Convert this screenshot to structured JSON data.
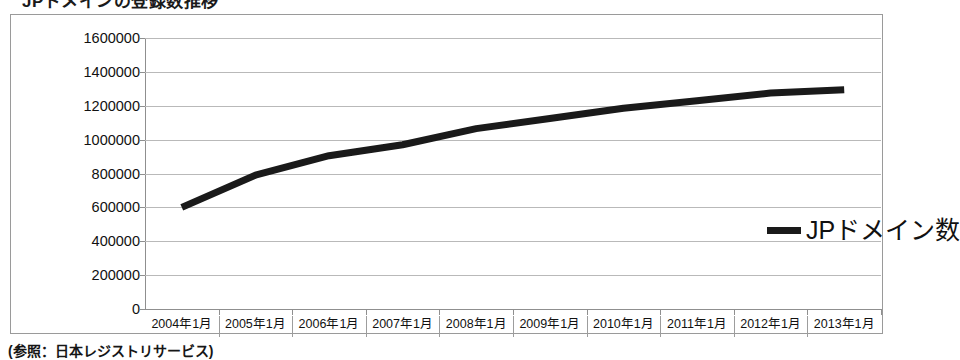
{
  "page": {
    "title_partial": "JPドメインの登録数推移",
    "caption": "(参照：日本レジストリサービス)"
  },
  "legend": {
    "series_label": "JPドメイン数",
    "position": "inside-right",
    "swatch_color": "#1a1a1a"
  },
  "colors": {
    "line": "#1a1a1a",
    "gridline": "#b9b9b9",
    "axis": "#8f8f8f",
    "frame_border": "#9a9a9a",
    "background": "#ffffff"
  },
  "chart_data": {
    "type": "line",
    "title": "JPドメインの登録数推移",
    "xlabel": "",
    "ylabel": "",
    "ylim": [
      0,
      1600000
    ],
    "ytick_step": 200000,
    "ytick_labels": [
      "1600000",
      "1400000",
      "1200000",
      "1000000",
      "800000",
      "600000",
      "400000",
      "200000",
      "0"
    ],
    "ytick_values": [
      1600000,
      1400000,
      1200000,
      1000000,
      800000,
      600000,
      400000,
      200000,
      0
    ],
    "grid": true,
    "legend_position": "inside-right",
    "categories": [
      "2004年1月",
      "2005年1月",
      "2006年1月",
      "2007年1月",
      "2008年1月",
      "2009年1月",
      "2010年1月",
      "2011年1月",
      "2012年1月",
      "2013年1月"
    ],
    "series": [
      {
        "name": "JPドメイン数",
        "color": "#1a1a1a",
        "values": [
          600000,
          790000,
          905000,
          970000,
          1065000,
          1125000,
          1185000,
          1230000,
          1275000,
          1295000
        ]
      }
    ]
  }
}
